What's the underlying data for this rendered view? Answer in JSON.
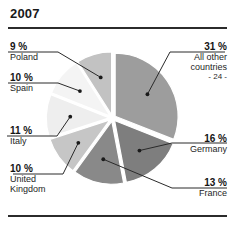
{
  "chart_data": {
    "type": "pie",
    "title": "2007",
    "xlabel": "",
    "ylabel": "",
    "legend_position": "callout-labels",
    "grid": false,
    "exploded": true,
    "categories": [
      "All other countries",
      "Germany",
      "France",
      "United Kingdom",
      "Italy",
      "Spain",
      "Poland"
    ],
    "values": [
      31,
      16,
      13,
      10,
      11,
      10,
      9
    ],
    "unit": "%",
    "slices": [
      {
        "label": "All other countries",
        "sublabel": "- 24 -",
        "value": 31,
        "value_text": "31 %",
        "color": "#9d9d9d",
        "side": "right"
      },
      {
        "label": "Germany",
        "sublabel": "",
        "value": 16,
        "value_text": "16 %",
        "color": "#7e7e7e",
        "side": "right"
      },
      {
        "label": "France",
        "sublabel": "",
        "value": 13,
        "value_text": "13 %",
        "color": "#898989",
        "side": "right"
      },
      {
        "label": "United Kingdom",
        "sublabel": "",
        "value": 10,
        "value_text": "10 %",
        "color": "#c6c6c6",
        "side": "left"
      },
      {
        "label": "Italy",
        "sublabel": "",
        "value": 11,
        "value_text": "11 %",
        "color": "#eeeeee",
        "side": "left"
      },
      {
        "label": "Spain",
        "sublabel": "",
        "value": 10,
        "value_text": "10 %",
        "color": "#f4f4f4",
        "side": "left"
      },
      {
        "label": "Poland",
        "sublabel": "",
        "value": 9,
        "value_text": "9 %",
        "color": "#c2c2c2",
        "side": "left"
      }
    ]
  },
  "labels": {
    "poland_pct": "9 %",
    "poland_name": "Poland",
    "spain_pct": "10 %",
    "spain_name": "Spain",
    "italy_pct": "11 %",
    "italy_name": "Italy",
    "uk_pct": "10 %",
    "uk_name_line1": "United",
    "uk_name_line2": "Kingdom",
    "other_pct": "31 %",
    "other_name_line1": "All other",
    "other_name_line2": "countries",
    "other_sub": "- 24 -",
    "germany_pct": "16 %",
    "germany_name": "Germany",
    "france_pct": "13 %",
    "france_name": "France"
  }
}
